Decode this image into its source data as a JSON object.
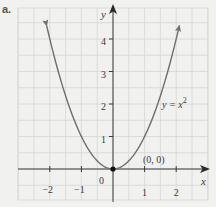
{
  "part_label": "a.",
  "chart_data": {
    "type": "line",
    "title": "",
    "function": "y = x^2",
    "xlabel": "x",
    "ylabel": "y",
    "xlim": [
      -2.5,
      2.5
    ],
    "ylim": [
      -0.6,
      4.8
    ],
    "grid": true,
    "grid_step": 0.5,
    "x_ticks": [
      -2,
      -1,
      1,
      2
    ],
    "x_tick_labels": [
      "−2",
      "−1",
      "1",
      "2"
    ],
    "y_ticks": [
      1,
      2,
      3,
      4
    ],
    "y_tick_labels": [
      "1",
      "2",
      "3",
      "4"
    ],
    "origin_label": "0",
    "series": [
      {
        "name": "y = x^2",
        "x": [
          -2.1,
          -2,
          -1.5,
          -1,
          -0.5,
          0,
          0.5,
          1,
          1.5,
          2,
          2.1
        ],
        "y": [
          4.41,
          4,
          2.25,
          1,
          0.25,
          0,
          0.25,
          1,
          2.25,
          4,
          4.41
        ],
        "arrows_at_ends": true
      }
    ],
    "annotations": [
      {
        "text": "(0, 0)",
        "point": [
          0,
          0
        ],
        "marked": true
      },
      {
        "text_main": "y = x",
        "text_sup": "2",
        "position": "right of curve near y=2"
      }
    ],
    "colors": {
      "curve": "#6e6e6e",
      "axis": "#3a3a3a",
      "grid": "#d6d6d6",
      "point": "#111111",
      "background": "#f1f1f0"
    }
  }
}
